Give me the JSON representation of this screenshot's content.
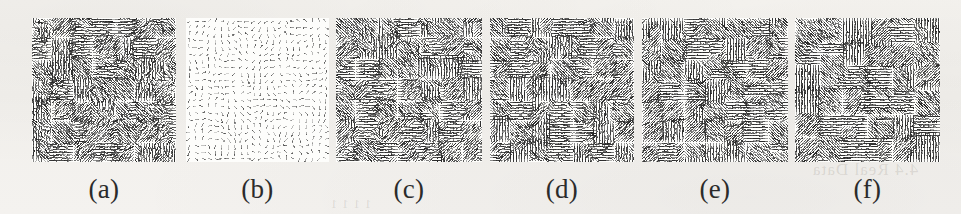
{
  "figure": {
    "kind": "vector-field-panel-row",
    "background_color": "#f4f2ee",
    "panel_background": "#fdfdfb",
    "ink_color": "#1d1d1d",
    "panel_count": 6,
    "panels": [
      {
        "id": "a",
        "label": "(a)",
        "x": 32,
        "y": 18,
        "w": 144,
        "h": 144,
        "density": "dense",
        "style": "blocky piecewise-constant flow field",
        "grid": 52,
        "arrow_length": 5.0,
        "seed": 11,
        "block_scale": 3.4,
        "noise": 0.42,
        "opacity": 0.95
      },
      {
        "id": "b",
        "label": "(b)",
        "x": 186,
        "y": 18,
        "w": 143,
        "h": 144,
        "density": "sparse",
        "style": "smooth low-magnitude flow field",
        "grid": 22,
        "arrow_length": 4.6,
        "seed": 27,
        "block_scale": 1.25,
        "noise": 0.1,
        "opacity": 0.82
      },
      {
        "id": "c",
        "label": "(c)",
        "x": 336,
        "y": 18,
        "w": 146,
        "h": 144,
        "density": "dense",
        "style": "blocky piecewise-constant flow field",
        "grid": 52,
        "arrow_length": 5.0,
        "seed": 33,
        "block_scale": 3.4,
        "noise": 0.34,
        "opacity": 0.95
      },
      {
        "id": "d",
        "label": "(d)",
        "x": 490,
        "y": 18,
        "w": 144,
        "h": 144,
        "density": "dense",
        "style": "blocky piecewise-constant flow field",
        "grid": 52,
        "arrow_length": 5.0,
        "seed": 47,
        "block_scale": 3.4,
        "noise": 0.3,
        "opacity": 0.95
      },
      {
        "id": "e",
        "label": "(e)",
        "x": 642,
        "y": 18,
        "w": 146,
        "h": 144,
        "density": "dense",
        "style": "blocky piecewise-constant flow field",
        "grid": 52,
        "arrow_length": 5.0,
        "seed": 59,
        "block_scale": 3.4,
        "noise": 0.28,
        "opacity": 0.95
      },
      {
        "id": "f",
        "label": "(f)",
        "x": 795,
        "y": 18,
        "w": 145,
        "h": 144,
        "density": "dense",
        "style": "blocky piecewise-constant flow field",
        "grid": 52,
        "arrow_length": 5.0,
        "seed": 71,
        "block_scale": 3.0,
        "noise": 0.26,
        "opacity": 0.95
      }
    ]
  },
  "bleed_through": [
    {
      "text": "4.4  Real Data",
      "x": 812,
      "y": 160,
      "size": 17
    },
    {
      "text": "1 1  1 1",
      "x": 330,
      "y": 196,
      "size": 13
    }
  ]
}
